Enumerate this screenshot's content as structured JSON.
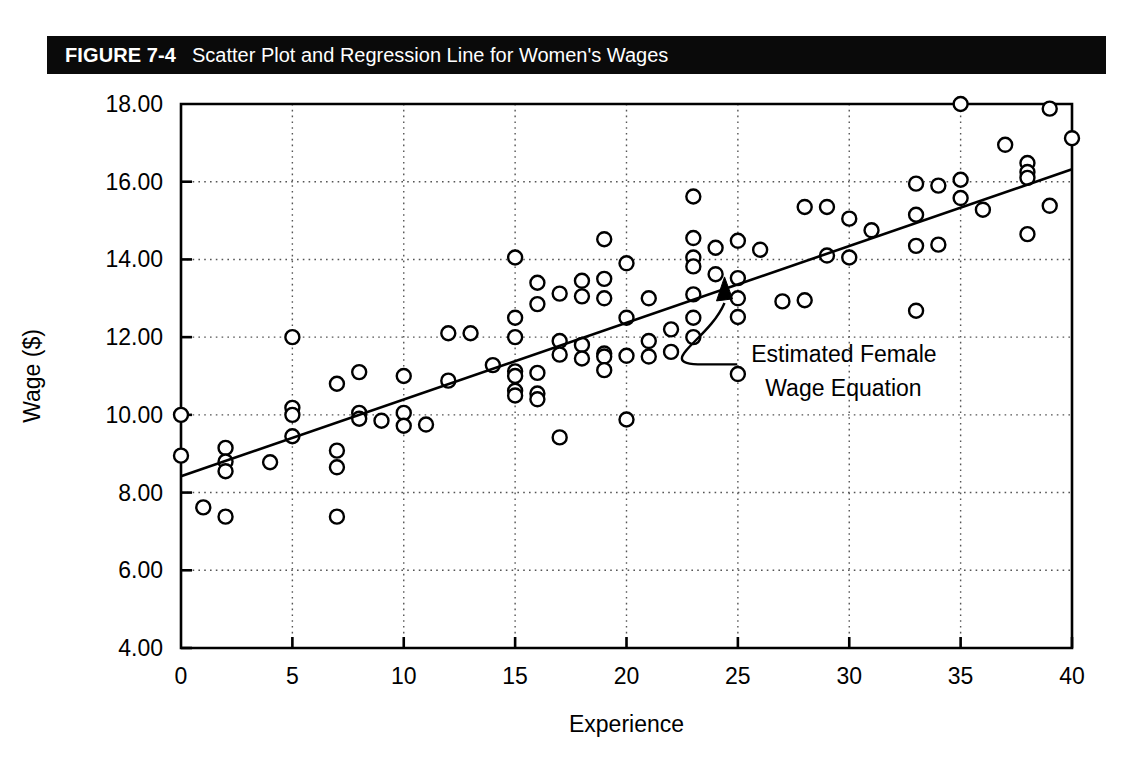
{
  "figure": {
    "number_label": "FIGURE 7-4",
    "caption": "Scatter Plot and Regression Line for Women's Wages",
    "header_background": "#0a0a0a",
    "header_text_color": "#ffffff"
  },
  "chart_data": {
    "type": "scatter",
    "title": "Scatter Plot and Regression Line for Women's Wages",
    "xlabel": "Experience",
    "ylabel": "Wage ($)",
    "xlim": [
      0,
      40
    ],
    "ylim": [
      4.0,
      18.0
    ],
    "xticks": [
      0,
      5,
      10,
      15,
      20,
      25,
      30,
      35,
      40
    ],
    "xtick_labels": [
      "0",
      "5",
      "10",
      "15",
      "20",
      "25",
      "30",
      "35",
      "40"
    ],
    "yticks": [
      4.0,
      6.0,
      8.0,
      10.0,
      12.0,
      14.0,
      16.0,
      18.0
    ],
    "ytick_labels": [
      "4.00",
      "6.00",
      "8.00",
      "10.00",
      "12.00",
      "14.00",
      "16.00",
      "18.00"
    ],
    "grid": true,
    "grid_style": "dotted",
    "legend": null,
    "marker": {
      "shape": "circle-open",
      "edge_color": "#000000",
      "face_color": "#ffffff",
      "radius": 7
    },
    "points": [
      [
        0,
        10.0
      ],
      [
        0,
        8.95
      ],
      [
        1,
        7.62
      ],
      [
        2,
        9.15
      ],
      [
        2,
        8.8
      ],
      [
        2,
        8.55
      ],
      [
        2,
        7.38
      ],
      [
        4,
        8.78
      ],
      [
        5,
        12.0
      ],
      [
        5,
        10.18
      ],
      [
        5,
        10.0
      ],
      [
        5,
        9.45
      ],
      [
        7,
        10.8
      ],
      [
        7,
        9.08
      ],
      [
        7,
        8.65
      ],
      [
        7,
        7.38
      ],
      [
        8,
        11.1
      ],
      [
        8,
        10.05
      ],
      [
        8,
        9.9
      ],
      [
        9,
        9.85
      ],
      [
        10,
        11.0
      ],
      [
        10,
        10.05
      ],
      [
        10,
        9.72
      ],
      [
        11,
        9.75
      ],
      [
        12,
        12.1
      ],
      [
        12,
        10.88
      ],
      [
        13,
        12.1
      ],
      [
        14,
        11.28
      ],
      [
        15,
        14.05
      ],
      [
        15,
        12.5
      ],
      [
        15,
        12.0
      ],
      [
        15,
        11.12
      ],
      [
        15,
        11.0
      ],
      [
        15,
        10.62
      ],
      [
        15,
        10.5
      ],
      [
        16,
        13.4
      ],
      [
        16,
        12.85
      ],
      [
        16,
        11.08
      ],
      [
        16,
        10.55
      ],
      [
        16,
        10.4
      ],
      [
        17,
        13.12
      ],
      [
        17,
        11.9
      ],
      [
        17,
        11.55
      ],
      [
        17,
        9.42
      ],
      [
        18,
        13.45
      ],
      [
        18,
        13.05
      ],
      [
        18,
        11.8
      ],
      [
        18,
        11.45
      ],
      [
        19,
        14.52
      ],
      [
        19,
        13.5
      ],
      [
        19,
        13.0
      ],
      [
        19,
        11.58
      ],
      [
        19,
        11.5
      ],
      [
        19,
        11.15
      ],
      [
        20,
        13.9
      ],
      [
        20,
        12.5
      ],
      [
        20,
        11.52
      ],
      [
        20,
        9.88
      ],
      [
        21,
        13.0
      ],
      [
        21,
        11.9
      ],
      [
        21,
        11.5
      ],
      [
        22,
        12.2
      ],
      [
        22,
        11.62
      ],
      [
        23,
        15.62
      ],
      [
        23,
        14.55
      ],
      [
        23,
        14.05
      ],
      [
        23,
        13.82
      ],
      [
        23,
        13.1
      ],
      [
        23,
        12.5
      ],
      [
        23,
        12.0
      ],
      [
        24,
        14.3
      ],
      [
        24,
        13.62
      ],
      [
        25,
        14.48
      ],
      [
        25,
        13.52
      ],
      [
        25,
        13.0
      ],
      [
        25,
        12.52
      ],
      [
        25,
        11.05
      ],
      [
        26,
        14.25
      ],
      [
        27,
        12.92
      ],
      [
        28,
        15.35
      ],
      [
        28,
        12.95
      ],
      [
        29,
        15.35
      ],
      [
        29,
        14.1
      ],
      [
        30,
        15.05
      ],
      [
        30,
        14.05
      ],
      [
        31,
        14.75
      ],
      [
        33,
        15.95
      ],
      [
        33,
        15.15
      ],
      [
        33,
        14.35
      ],
      [
        33,
        12.68
      ],
      [
        34,
        15.9
      ],
      [
        34,
        14.38
      ],
      [
        35,
        18.0
      ],
      [
        35,
        16.05
      ],
      [
        35,
        15.58
      ],
      [
        36,
        15.28
      ],
      [
        37,
        16.95
      ],
      [
        38,
        16.48
      ],
      [
        38,
        16.25
      ],
      [
        38,
        16.1
      ],
      [
        38,
        14.65
      ],
      [
        39,
        17.88
      ],
      [
        39,
        15.38
      ],
      [
        40,
        17.12
      ]
    ],
    "regression_line": {
      "label": "Estimated Female Wage Equation",
      "x_start": 0,
      "y_start": 8.42,
      "x_end": 40,
      "y_end": 16.32,
      "color": "#000000",
      "width": 2.6
    },
    "annotation": {
      "text_line_1": "Estimated Female",
      "text_line_2": "Wage Equation",
      "text_x": 25.6,
      "text_y": 11.35,
      "arrow_tip_x": 24.4,
      "arrow_tip_y": 13.55,
      "arrow_style": "curved-arrow"
    }
  }
}
